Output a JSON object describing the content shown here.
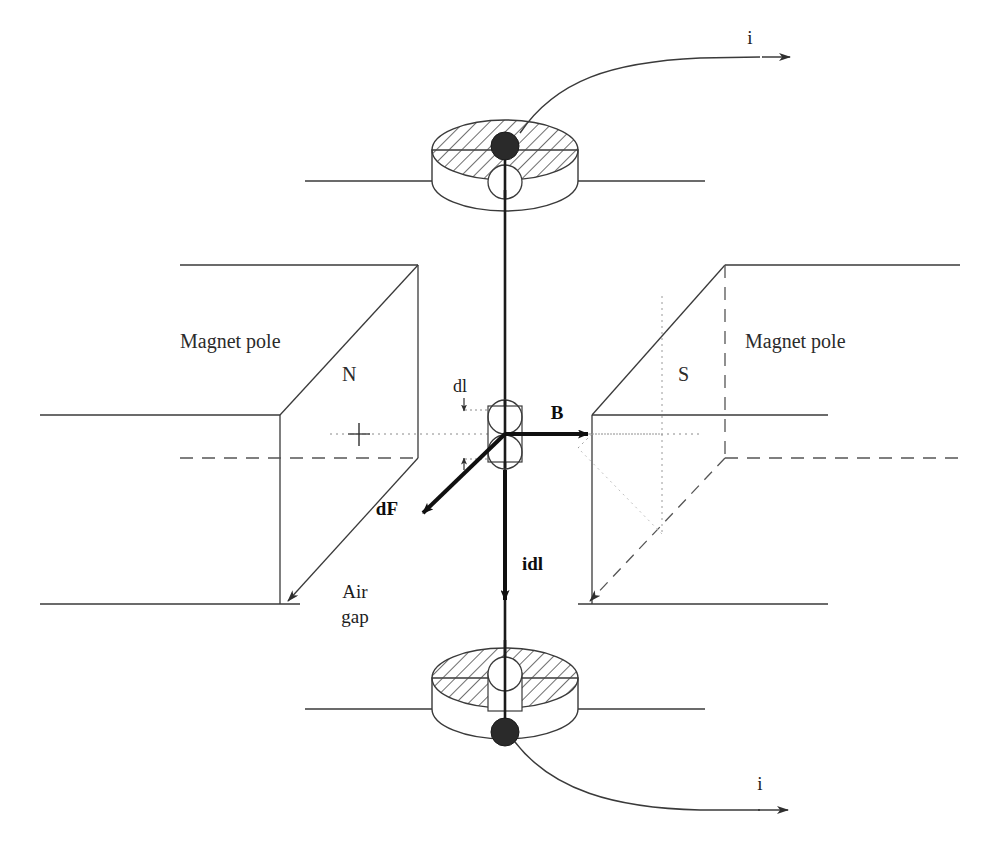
{
  "figure": {
    "background_color": "#ffffff",
    "line_color": "#3a3a3a",
    "bold_line_color": "#101010",
    "text_color": "#1c1c1c"
  },
  "labels": {
    "current_top": "i",
    "current_bottom": "i",
    "magnet_pole_left": "Magnet pole",
    "magnet_pole_right": "Magnet pole",
    "north_pole": "N",
    "south_pole": "S",
    "air_gap_line1": "Air",
    "air_gap_line2": "gap",
    "flux_density": "B",
    "current_element": "idl",
    "force": "dF",
    "length_element": "dl"
  },
  "vectors": [
    {
      "name": "B",
      "label": "B",
      "direction": "right",
      "from_x": 505,
      "from_y": 434,
      "to_x": 592,
      "to_y": 434
    },
    {
      "name": "idl",
      "label": "idl",
      "direction": "down",
      "from_x": 505,
      "from_y": 434,
      "to_x": 505,
      "to_y": 604
    },
    {
      "name": "dF",
      "label": "dF",
      "direction": "down-left",
      "from_x": 505,
      "from_y": 434,
      "to_x": 419,
      "to_y": 516
    }
  ],
  "elements": {
    "top_coil": {
      "name": "top-coil-cylinder",
      "center_x": 505,
      "center_y": 150,
      "rx": 73,
      "ry": 30,
      "height": 48,
      "hatched": true
    },
    "bottom_coil": {
      "name": "bottom-coil-cylinder",
      "center_x": 505,
      "center_y": 678,
      "rx": 73,
      "ry": 30,
      "height": 48,
      "hatched": true
    },
    "conductor": {
      "name": "vertical-conductor",
      "x": 505,
      "top_y": 150,
      "bottom_y": 740
    }
  },
  "colors": {
    "hatch": "#555555",
    "terminal_dot": "#2a2a2a",
    "dashed_hidden": "#555555",
    "dotted_center": "#777777"
  }
}
